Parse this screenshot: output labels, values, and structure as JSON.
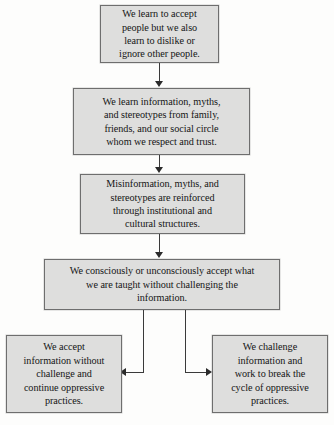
{
  "diagram": {
    "background_color": "#fdfdfc",
    "node_fill_color": "#dededd",
    "node_border_color": "#6e6e6e",
    "connector_color": "#3a3a3a",
    "nodes": [
      {
        "id": "node1",
        "text": "We learn to accept\npeople but we also\nlearn to dislike or\nignore other people."
      },
      {
        "id": "node2",
        "text": "We learn information, myths,\nand stereotypes from family,\nfriends, and our social circle\nwhom we respect and trust."
      },
      {
        "id": "node3",
        "text": "Misinformation, myths, and\nstereotypes are reinforced\nthrough institutional and\ncultural structures."
      },
      {
        "id": "node4",
        "text": "We consciously or unconsciously accept what\nwe are taught without challenging the\ninformation."
      },
      {
        "id": "node5",
        "text": "We accept\ninformation without\nchallenge and\ncontinue oppressive\npractices."
      },
      {
        "id": "node6",
        "text": "We challenge\ninformation and\nwork to break the\ncycle of oppressive\npractices."
      }
    ],
    "connectors": [
      {
        "id": "c1",
        "from": "node1",
        "to": "node2",
        "direction": "down"
      },
      {
        "id": "c2",
        "from": "node2",
        "to": "node3",
        "direction": "down"
      },
      {
        "id": "c3",
        "from": "node3",
        "to": "node4",
        "direction": "down"
      },
      {
        "id": "c4",
        "from": "node4",
        "to": "node5",
        "direction": "down-then-left"
      },
      {
        "id": "c5",
        "from": "node4",
        "to": "node6",
        "direction": "down-then-right"
      }
    ]
  }
}
